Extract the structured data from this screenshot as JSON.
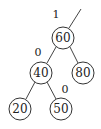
{
  "diagram": {
    "type": "binary-tree",
    "nodes": [
      {
        "id": "n60",
        "label": "60",
        "cx": 63,
        "cy": 38
      },
      {
        "id": "n40",
        "label": "40",
        "cx": 41,
        "cy": 73
      },
      {
        "id": "n80",
        "label": "80",
        "cx": 83,
        "cy": 73
      },
      {
        "id": "n20",
        "label": "20",
        "cx": 20,
        "cy": 109
      },
      {
        "id": "n50",
        "label": "50",
        "cx": 61,
        "cy": 109
      }
    ],
    "edges": [
      {
        "from": "parent",
        "to": "n60"
      },
      {
        "from": "n60",
        "to": "n40"
      },
      {
        "from": "n60",
        "to": "n80"
      },
      {
        "from": "n40",
        "to": "n20"
      },
      {
        "from": "n40",
        "to": "n50"
      }
    ],
    "balance_labels": [
      {
        "for": "n60",
        "text": "1",
        "x": 56,
        "y": 14
      },
      {
        "for": "n40",
        "text": "0",
        "x": 38,
        "y": 52
      },
      {
        "for": "n50",
        "text": "0",
        "x": 65,
        "y": 89
      }
    ]
  }
}
